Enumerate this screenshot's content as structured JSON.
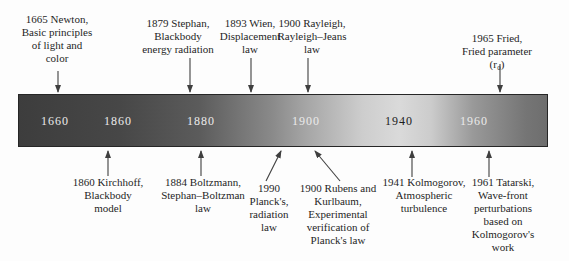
{
  "figure": {
    "background_color": "#fdfdfd",
    "bar_gradient_left": "#3d3d3d",
    "bar_gradient_peak": "#dadada",
    "bar_gradient_right": "#6e6e6e",
    "year_label_color_light": "#ebebeb",
    "year_label_color_dark": "#1c1c1c",
    "arrow_color": "#3f3f3f",
    "text_color": "#1f1f1f"
  },
  "timeline": {
    "years": [
      {
        "label": "1660"
      },
      {
        "label": "1860"
      },
      {
        "label": "1880"
      },
      {
        "label": "1900"
      },
      {
        "label": "1940"
      },
      {
        "label": "1960"
      }
    ]
  },
  "events": {
    "top": [
      {
        "label": "1665 Newton,\nBasic principles\nof light and\ncolor"
      },
      {
        "label": "1879 Stephan,\nBlackbody\nenergy radiation"
      },
      {
        "label": "1893 Wien,\nDisplacement\nlaw"
      },
      {
        "label": "1900 Rayleigh,\nRayleigh–Jeans\nlaw"
      },
      {
        "label": "1965 Fried,\nFried parameter (r₀)"
      }
    ],
    "bottom": [
      {
        "label": "1860 Kirchhoff,\nBlackbody\nmodel"
      },
      {
        "label": "1884 Boltzmann,\nStephan–Boltzman\nlaw"
      },
      {
        "label": "1990\nPlanck's,\nradiation\nlaw"
      },
      {
        "label": "1900 Rubens and\nKurlbaum,\nExperimental\nverification of\nPlanck's law"
      },
      {
        "label": "1941 Kolmogorov,\nAtmospheric\nturbulence"
      },
      {
        "label": "1961 Tatarski,\nWave-front\nperturbations\nbased on\nKolmogorov's work"
      }
    ]
  }
}
